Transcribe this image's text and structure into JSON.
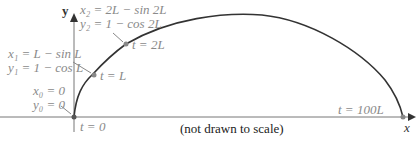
{
  "axes": {
    "x_label": "x",
    "y_label": "y"
  },
  "note": "(not drawn to scale)",
  "points": [
    {
      "t_label": "t = 0",
      "x_eq": "x₀ = 0",
      "y_eq": "y₀ = 0"
    },
    {
      "t_label": "t = L",
      "x_eq": "x₁ = L − sin L",
      "y_eq": "y₁ = 1 − cos L"
    },
    {
      "t_label": "t = 2L",
      "x_eq": "x₂ = 2L − sin 2L",
      "y_eq": "y₂ = 1 − cos 2L"
    },
    {
      "t_label": "t = 100L"
    }
  ],
  "colors": {
    "curve": "#333333",
    "axis": "#777777",
    "label": "#8a8a8a",
    "point": "#888888"
  }
}
